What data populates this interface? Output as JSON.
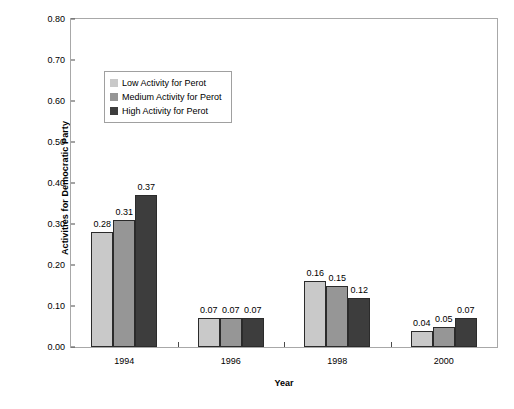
{
  "chart_data": {
    "type": "bar",
    "title": "",
    "xlabel": "Year",
    "ylabel": "Activities for Democratic Party",
    "categories": [
      "1994",
      "1996",
      "1998",
      "2000"
    ],
    "series": [
      {
        "name": "Low Activity for Perot",
        "color": "#c9c9c9",
        "values": [
          0.28,
          0.07,
          0.16,
          0.04
        ]
      },
      {
        "name": "Medium Activity for Perot",
        "color": "#969696",
        "values": [
          0.31,
          0.07,
          0.15,
          0.05
        ]
      },
      {
        "name": "High Activity for Perot",
        "color": "#3d3d3d",
        "values": [
          0.37,
          0.07,
          0.12,
          0.07
        ]
      }
    ],
    "value_labels": [
      [
        "0.28",
        "0.31",
        "0.37"
      ],
      [
        "0.07",
        "0.07",
        "0.07"
      ],
      [
        "0.16",
        "0.15",
        "0.12"
      ],
      [
        "0.04",
        "0.05",
        "0.07"
      ]
    ],
    "ylim": [
      0.0,
      0.8
    ],
    "ytick_labels": [
      "0.00",
      "0.10",
      "0.20",
      "0.30",
      "0.40",
      "0.50",
      "0.60",
      "0.70",
      "0.80"
    ],
    "ytick_values": [
      0.0,
      0.1,
      0.2,
      0.3,
      0.4,
      0.5,
      0.6,
      0.7,
      0.8
    ],
    "grid": false,
    "legend_position": "upper-left-inside"
  },
  "legend": {
    "items": [
      {
        "label": "Low Activity for Perot"
      },
      {
        "label": "Medium Activity for Perot"
      },
      {
        "label": "High Activity for Perot"
      }
    ]
  }
}
